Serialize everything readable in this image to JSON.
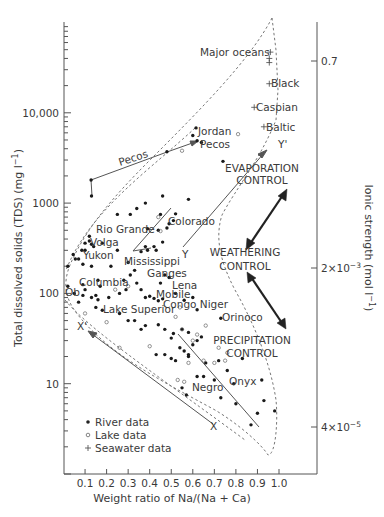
{
  "chart_data": {
    "type": "scatter",
    "title": "",
    "xlabel": "Weight ratio of Na/(Na + Ca)",
    "ylabel": "Total dissolved solids (TDS) (mg l⁻¹)",
    "y2label": "Ionic strength (mol l⁻¹)",
    "xlim": [
      0,
      1.05
    ],
    "ylim": [
      1,
      100000
    ],
    "yscale": "log",
    "grid": false,
    "x_ticks": [
      0.1,
      0.2,
      0.3,
      0.4,
      0.5,
      0.6,
      0.7,
      0.8,
      0.9,
      1.0
    ],
    "x_tick_labels": [
      "0.1",
      "0.2",
      "0.3",
      "0.4",
      "0.5",
      "0.6",
      "0.7",
      "0.8",
      "0.9",
      "1.0"
    ],
    "y_ticks": [
      10,
      100,
      1000,
      10000
    ],
    "y_tick_labels": [
      "10",
      "100",
      "1000",
      "10,000"
    ],
    "y2_ticks": [
      {
        "label": "0.7",
        "tds": 26000
      },
      {
        "label": "2×10⁻³",
        "tds": 130
      },
      {
        "label": "4×10⁻⁵",
        "tds": 2.3
      }
    ],
    "legend": {
      "position": "lower left",
      "entries": [
        {
          "marker": "filled-circle",
          "label": "River data"
        },
        {
          "marker": "open-circle",
          "label": "Lake data"
        },
        {
          "marker": "plus",
          "label": "Seawater data"
        }
      ]
    },
    "series": [
      {
        "name": "River data",
        "marker": "filled-circle",
        "points": [
          [
            0.615,
            6800
          ],
          [
            0.62,
            4900
          ],
          [
            0.64,
            4700
          ],
          [
            0.6,
            5600
          ],
          [
            0.48,
            3700
          ],
          [
            0.128,
            1800
          ],
          [
            0.13,
            1200
          ],
          [
            0.74,
            2900
          ],
          [
            0.46,
            1200
          ],
          [
            0.38,
            1000
          ],
          [
            0.58,
            1100
          ],
          [
            0.34,
            870
          ],
          [
            0.45,
            750
          ],
          [
            0.31,
            750
          ],
          [
            0.25,
            750
          ],
          [
            0.51,
            640
          ],
          [
            0.52,
            760
          ],
          [
            0.49,
            590
          ],
          [
            0.48,
            530
          ],
          [
            0.46,
            370
          ],
          [
            0.44,
            500
          ],
          [
            0.39,
            520
          ],
          [
            0.12,
            430
          ],
          [
            0.36,
            290
          ],
          [
            0.38,
            330
          ],
          [
            0.39,
            300
          ],
          [
            0.42,
            330
          ],
          [
            0.43,
            300
          ],
          [
            0.25,
            300
          ],
          [
            0.1,
            360
          ],
          [
            0.12,
            380
          ],
          [
            0.13,
            350
          ],
          [
            0.14,
            330
          ],
          [
            0.18,
            360
          ],
          [
            0.085,
            300
          ],
          [
            0.045,
            270
          ],
          [
            0.055,
            240
          ],
          [
            0.07,
            240
          ],
          [
            0.09,
            210
          ],
          [
            0.1,
            300
          ],
          [
            0.13,
            200
          ],
          [
            0.02,
            200
          ],
          [
            0.22,
            200
          ],
          [
            0.28,
            140
          ],
          [
            0.3,
            220
          ],
          [
            0.31,
            160
          ],
          [
            0.33,
            180
          ],
          [
            0.34,
            130
          ],
          [
            0.45,
            130
          ],
          [
            0.47,
            160
          ],
          [
            0.49,
            150
          ],
          [
            0.26,
            100
          ],
          [
            0.29,
            110
          ],
          [
            0.36,
            110
          ],
          [
            0.38,
            90
          ],
          [
            0.4,
            93
          ],
          [
            0.42,
            88
          ],
          [
            0.44,
            83
          ],
          [
            0.46,
            87
          ],
          [
            0.52,
            100
          ],
          [
            0.56,
            84
          ],
          [
            0.6,
            90
          ],
          [
            0.62,
            66
          ],
          [
            0.73,
            53
          ],
          [
            0.02,
            120
          ],
          [
            0.05,
            100
          ],
          [
            0.09,
            125
          ],
          [
            0.1,
            110
          ],
          [
            0.16,
            140
          ],
          [
            0.17,
            120
          ],
          [
            0.07,
            80
          ],
          [
            0.09,
            95
          ],
          [
            0.13,
            90
          ],
          [
            0.15,
            95
          ],
          [
            0.16,
            85
          ],
          [
            0.15,
            70
          ],
          [
            0.18,
            65
          ],
          [
            0.21,
            90
          ],
          [
            0.26,
            60
          ],
          [
            0.33,
            50
          ],
          [
            0.36,
            40
          ],
          [
            0.38,
            44
          ],
          [
            0.44,
            45
          ],
          [
            0.47,
            40
          ],
          [
            0.51,
            36
          ],
          [
            0.55,
            40
          ],
          [
            0.58,
            37
          ],
          [
            0.6,
            27
          ],
          [
            0.62,
            30
          ],
          [
            0.64,
            33
          ],
          [
            0.5,
            32
          ],
          [
            0.54,
            25
          ],
          [
            0.56,
            23
          ],
          [
            0.58,
            21
          ],
          [
            0.47,
            21
          ],
          [
            0.5,
            19
          ],
          [
            0.43,
            21
          ],
          [
            0.52,
            18
          ],
          [
            0.55,
            9
          ],
          [
            0.57,
            7.5
          ],
          [
            0.58,
            20
          ],
          [
            0.62,
            12
          ],
          [
            0.66,
            17
          ],
          [
            0.7,
            11
          ],
          [
            0.72,
            18
          ],
          [
            0.73,
            7
          ],
          [
            0.76,
            14
          ],
          [
            0.79,
            10
          ],
          [
            0.8,
            6
          ],
          [
            0.83,
            19
          ],
          [
            0.9,
            4.7
          ],
          [
            0.92,
            11
          ],
          [
            0.93,
            6.5
          ],
          [
            0.98,
            5
          ],
          [
            0.87,
            3.5
          ],
          [
            0.65,
            12
          ],
          [
            0.3,
            50
          ]
        ]
      },
      {
        "name": "Lake data",
        "marker": "open-circle",
        "points": [
          [
            0.55,
            3800
          ],
          [
            0.81,
            5800
          ],
          [
            0.44,
            700
          ],
          [
            0.45,
            490
          ],
          [
            0.24,
            110
          ],
          [
            0.3,
            120
          ],
          [
            0.1,
            60
          ],
          [
            0.2,
            48
          ],
          [
            0.52,
            55
          ],
          [
            0.55,
            40
          ],
          [
            0.54,
            70
          ],
          [
            0.62,
            35
          ],
          [
            0.66,
            44
          ],
          [
            0.6,
            30
          ],
          [
            0.26,
            25
          ],
          [
            0.4,
            26
          ],
          [
            0.53,
            11
          ],
          [
            0.56,
            10.5
          ],
          [
            0.58,
            17
          ],
          [
            0.65,
            18
          ],
          [
            0.7,
            17
          ],
          [
            0.75,
            18
          ],
          [
            0.76,
            22
          ],
          [
            0.72,
            25
          ]
        ]
      },
      {
        "name": "Seawater data",
        "marker": "plus",
        "points": [
          [
            0.96,
            47000
          ],
          [
            0.955,
            40000
          ],
          [
            0.955,
            36000
          ],
          [
            0.955,
            21000
          ],
          [
            0.885,
            11500
          ],
          [
            0.93,
            7000
          ]
        ]
      }
    ],
    "annotations": {
      "rivers": [
        {
          "label": "Jordan",
          "x": 0.615,
          "y": 6800
        },
        {
          "label": "Pecos",
          "x": 0.62,
          "y": 4900
        },
        {
          "label": "Pecos",
          "x": 0.3,
          "y": 2600,
          "rotated": true
        },
        {
          "label": "Rio Grande",
          "x": 0.39,
          "y": 520
        },
        {
          "label": "Colorado",
          "x": 0.48,
          "y": 590
        },
        {
          "label": "Volga",
          "x": 0.12,
          "y": 380
        },
        {
          "label": "Yukon",
          "x": 0.115,
          "y": 295
        },
        {
          "label": "Mississippi",
          "x": 0.28,
          "y": 120
        },
        {
          "label": "Columbia",
          "x": 0.1,
          "y": 110
        },
        {
          "label": "Ob",
          "x": 0.02,
          "y": 120
        },
        {
          "label": "Ganges",
          "x": 0.45,
          "y": 130
        },
        {
          "label": "Lena",
          "x": 0.49,
          "y": 150
        },
        {
          "label": "Mobile",
          "x": 0.42,
          "y": 93
        },
        {
          "label": "Congo",
          "x": 0.44,
          "y": 83
        },
        {
          "label": "Niger",
          "x": 0.62,
          "y": 66
        },
        {
          "label": "Lake Superior",
          "x": 0.13,
          "y": 90
        },
        {
          "label": "Orinoco",
          "x": 0.73,
          "y": 53
        },
        {
          "label": "Negro",
          "x": 0.57,
          "y": 7.5
        },
        {
          "label": "Onyx",
          "x": 0.72,
          "y": 18
        }
      ],
      "seas": [
        {
          "label": "Major oceans",
          "x": 0.96,
          "y": 47000
        },
        {
          "label": "Black",
          "x": 0.955,
          "y": 21000
        },
        {
          "label": "Caspian",
          "x": 0.885,
          "y": 11500
        },
        {
          "label": "Baltic",
          "x": 0.93,
          "y": 7000
        }
      ],
      "trend_labels": [
        "X",
        "X'",
        "Y",
        "Y'"
      ],
      "control_labels": [
        "EVAPORATION CONTROL",
        "WEATHERING CONTROL",
        "PRECIPITATION CONTROL"
      ]
    }
  },
  "axes": {
    "xlabel": "Weight ratio of Na/(Na + Ca)",
    "ylabel": "Total dissolved solids (TDS) (mg l",
    "ylabel_sup": "−1",
    "ylabel_end": ")",
    "y2label": "Ionic strength (mol l",
    "y2label_sup": "−1",
    "y2label_end": ")",
    "y_ticks": {
      "t10000": "10,000",
      "t1000": "1000",
      "t100": "100",
      "t10": "10"
    },
    "x_ticks": [
      "0.1",
      "0.2",
      "0.3",
      "0.4",
      "0.5",
      "0.6",
      "0.7",
      "0.8",
      "0.9",
      "1.0"
    ],
    "y2_ticks": {
      "a_base": "0.7",
      "b_base": "2×10",
      "b_exp": "−3",
      "c_base": "4×10",
      "c_exp": "−5"
    }
  },
  "legend": {
    "river": "River data",
    "lake": "Lake data",
    "seawater": "Seawater data"
  },
  "labels": {
    "major_oceans": "Major oceans",
    "black": "Black",
    "caspian": "Caspian",
    "baltic": "Baltic",
    "jordan": "Jordan",
    "pecos": "Pecos",
    "pecos_line": "Pecos",
    "colorado": "Colorado",
    "rio_grande": "Rio Grande",
    "volga": "Volga",
    "yukon": "Yukon",
    "mississippi": "Mississippi",
    "columbia": "Columbia",
    "ganges": "Ganges",
    "ob": "Ob",
    "lena": "Lena",
    "mobile": "Mobile",
    "congo_niger": "Congo Niger",
    "lake_superior": "Lake Superior",
    "orinoco": "Orinoco",
    "negro": "Negro",
    "onyx": "Onyx",
    "x": "X",
    "x_prime": "X'",
    "y": "Y",
    "y_prime": "Y'",
    "evaporation_1": "EVAPORATION",
    "evaporation_2": "CONTROL",
    "weathering_1": "WEATHERING",
    "weathering_2": "CONTROL",
    "precipitation_1": "PRECIPITATION",
    "precipitation_2": "CONTROL"
  }
}
